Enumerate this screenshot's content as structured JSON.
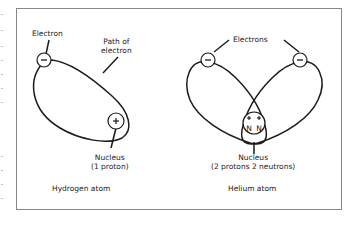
{
  "figure": {
    "hydrogen": {
      "electron_label": "Electron",
      "path_label_line1": "Path of",
      "path_label_line2": "electron",
      "nucleus_label_line1": "Nucleus",
      "nucleus_label_line2": "(1 proton)",
      "caption": "Hydrogen atom",
      "electron_symbol": "−",
      "proton_symbol": "+"
    },
    "helium": {
      "electrons_label": "Electrons",
      "nucleus_label_line1": "Nucleus",
      "nucleus_label_line2": "(2 protons 2 neutrons)",
      "caption": "Helium atom",
      "electron_symbol": "−",
      "proton_symbol": "+",
      "neutron_symbol": "N"
    }
  },
  "colors": {
    "ink": "#1a1a1a",
    "frame": "#888888",
    "background": "#ffffff"
  }
}
